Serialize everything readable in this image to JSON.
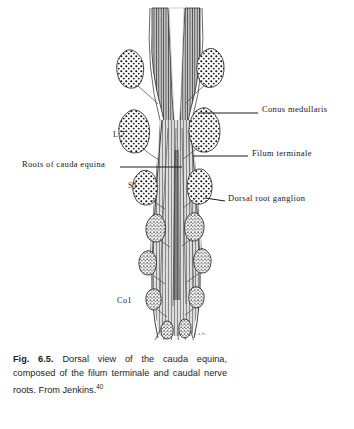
{
  "figure": {
    "title": "Dorsal view of the cauda equina",
    "background_color": "#ffffff",
    "ink_color": "#1a1a1a",
    "caption": {
      "figure_number": "Fig. 6.5.",
      "text_line_1": "Dorsal view of the",
      "text_line_2": "cauda equina, composed of",
      "text_line_3": "the filum terminale and caudal",
      "text_line_4": "nerve roots. From Jenkins.",
      "reference_superscript": "40",
      "full_text": "Fig. 6.5. Dorsal view of the cauda equina, composed of the filum terminale and caudal nerve roots. From Jenkins.40"
    },
    "annotations": [
      {
        "id": "conus-medullaris",
        "label": "Conus  medullaris",
        "side": "right",
        "x": 262,
        "y": 109
      },
      {
        "id": "filum-terminale",
        "label": "Filum  terminale",
        "side": "right",
        "x": 252,
        "y": 153
      },
      {
        "id": "dorsal-root-ganglion",
        "label": "Dorsal  root  ganglion",
        "side": "right",
        "x": 228,
        "y": 198
      },
      {
        "id": "roots-cauda-equina",
        "label": "Roots  of  cauda  equina",
        "side": "left",
        "x": 22,
        "y": 164
      }
    ],
    "vertebral_levels": [
      {
        "id": "l7",
        "label": "L 7",
        "x": 113,
        "y": 134
      },
      {
        "id": "s1",
        "label": "S1",
        "x": 128,
        "y": 185
      },
      {
        "id": "co1",
        "label": "Co1",
        "x": 117,
        "y": 300
      }
    ],
    "artist_signature": "a.a.b."
  }
}
